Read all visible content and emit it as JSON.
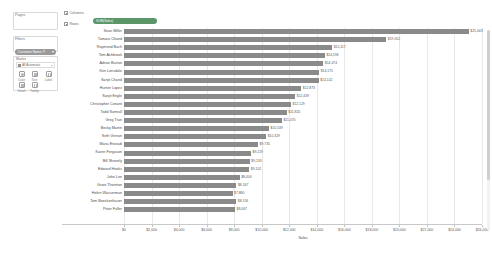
{
  "sidebar": {
    "pages": {
      "label": "Pages"
    },
    "filters": {
      "label": "Filters",
      "pill": "Customer Name: P"
    },
    "marks": {
      "label": "Marks",
      "type": "All Automatic",
      "buttons": [
        {
          "label": "Color",
          "icon": "color-icon"
        },
        {
          "label": "Size",
          "icon": "size-icon"
        },
        {
          "label": "Label",
          "icon": "label-icon"
        },
        {
          "label": "Detail",
          "icon": "detail-icon"
        },
        {
          "label": "Tooltip",
          "icon": "tooltip-icon"
        }
      ]
    }
  },
  "shelves": {
    "columns": {
      "label": "Columns",
      "pill": "SUM(Sales)"
    },
    "rows": {
      "label": "Rows",
      "pill": "Customer Name"
    }
  },
  "colors": {
    "bar": "#8a8a8a",
    "pill_blue": "#4a7fa8",
    "pill_green": "#5a9668",
    "grid": "#e8e8e8"
  },
  "chart_data": {
    "type": "bar",
    "orientation": "horizontal",
    "title": "",
    "xlabel": "Sales",
    "ylabel": "Customer Name",
    "xlim": [
      0,
      26000
    ],
    "grid": true,
    "legend": "none",
    "tick_labels": [
      "$0",
      "$2,000",
      "$4,000",
      "$6,000",
      "$8,000",
      "$10,000",
      "$12,000",
      "$14,000",
      "$16,000",
      "$18,000",
      "$20,000",
      "$22,000",
      "$24,000",
      "$26,000"
    ],
    "tick_values": [
      0,
      2000,
      4000,
      6000,
      8000,
      10000,
      12000,
      14000,
      16000,
      18000,
      20000,
      22000,
      24000,
      26000
    ],
    "categories": [
      "Sean Miller",
      "Tamara Chand",
      "Raymond Buch",
      "Tom Ashbrook",
      "Adrian Barton",
      "Ken Lonsdale",
      "Sanjit Chand",
      "Hunter Lopez",
      "Sanjit Engle",
      "Christopher Conant",
      "Todd Sumrall",
      "Greg Tran",
      "Becky Martin",
      "Seth Vernon",
      "Maria Etezadi",
      "Karen Ferguson",
      "Bill Shonely",
      "Edward Hooks",
      "John Lee",
      "Grant Thornton",
      "Helen Wasserman",
      "Tom Boeckenhauer",
      "Peter Fuller"
    ],
    "values": [
      25043,
      19052,
      15117,
      14596,
      14474,
      14175,
      14142,
      12873,
      12439,
      12129,
      11820,
      11470,
      10539,
      10329,
      9735,
      9229,
      9133,
      9102,
      8400,
      8167,
      7880,
      8156,
      8067
    ],
    "value_labels": [
      "$25,043",
      "$19,052",
      "$15,117",
      "$14,596",
      "$14,474",
      "$14,175",
      "$14,142",
      "$12,873",
      "$12,439",
      "$12,129",
      "$11,820",
      "$11,470",
      "$10,539",
      "$10,329",
      "$9,735",
      "$9,229",
      "$9,133",
      "$9,102",
      "$8,400",
      "$8,167",
      "$7,880",
      "$8,156",
      "$8,067"
    ]
  }
}
